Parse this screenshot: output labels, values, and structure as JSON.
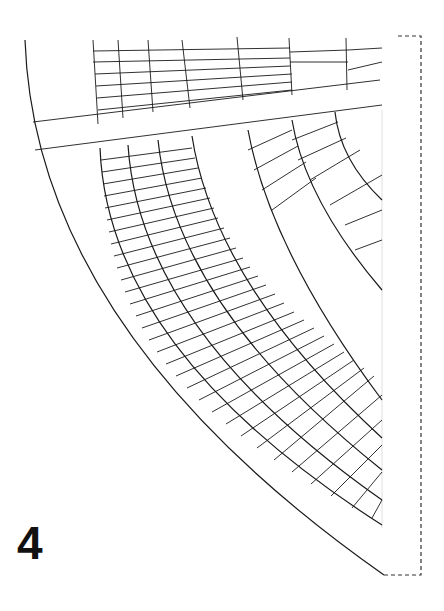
{
  "figure": {
    "page_number": "4",
    "colors": {
      "ink": "#1a1a1a",
      "background": "#ffffff",
      "dashed_border": "#333333"
    },
    "text_legibility": "labels in grid cells are printed too small and inverted to be legible"
  }
}
